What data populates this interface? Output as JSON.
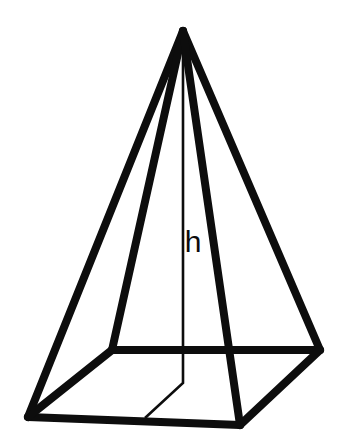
{
  "figure": {
    "kind": "hexagonal-pyramid-wireframe",
    "background_color": "#ffffff",
    "line_color": "#0d0d0d",
    "canvas": {
      "width": 344,
      "height": 440
    },
    "labels": {
      "height": "h"
    },
    "label_positions": {
      "height": {
        "x": 193,
        "y": 252,
        "font_size": 30
      }
    },
    "line_weights": {
      "edge_thick": 8,
      "edge_thin": 2.6
    },
    "vertices": {
      "apex": {
        "x": 183,
        "y": 31
      },
      "base_front_left": {
        "x": 28,
        "y": 417
      },
      "base_front_right": {
        "x": 240,
        "y": 425
      },
      "base_rear_left": {
        "x": 112,
        "y": 350
      },
      "base_rear_right": {
        "x": 320,
        "y": 350
      },
      "base_center": {
        "x": 183,
        "y": 383
      },
      "base_front_mid": {
        "x": 145,
        "y": 418
      }
    },
    "edges": [
      {
        "name": "apex-to-front-left",
        "from": "apex",
        "to": "base_front_left",
        "weight": "thick"
      },
      {
        "name": "apex-to-rear-left",
        "from": "apex",
        "to": "base_rear_left",
        "weight": "thick"
      },
      {
        "name": "apex-to-rear-right",
        "from": "apex",
        "to": "base_rear_right",
        "weight": "thick"
      },
      {
        "name": "apex-to-front-right",
        "from": "apex",
        "to": "base_front_right",
        "weight": "thick"
      },
      {
        "name": "base-front-edge",
        "from": "base_front_left",
        "to": "base_front_right",
        "weight": "thick"
      },
      {
        "name": "base-rear-edge",
        "from": "base_rear_left",
        "to": "base_rear_right",
        "weight": "thick"
      },
      {
        "name": "base-left-edge",
        "from": "base_front_left",
        "to": "base_rear_left",
        "weight": "thick"
      },
      {
        "name": "base-right-edge",
        "from": "base_front_right",
        "to": "base_rear_right",
        "weight": "thick"
      }
    ],
    "height_line": {
      "name": "altitude",
      "weight": "thin",
      "points": "183,31 183,383 145,418",
      "description": "vertical altitude from apex to base centre, then folded segment to the front base edge"
    }
  }
}
